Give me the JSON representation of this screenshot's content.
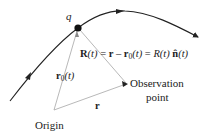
{
  "diagram": {
    "charge_label": "q",
    "equation": {
      "lhs_bold": "R",
      "lhs_arg": "(t)",
      "eq1": " = ",
      "r_bold": "r",
      "minus": " – ",
      "r0_bold": "r",
      "r0_sub": "0",
      "r0_arg": "(t)",
      "eq2": " = ",
      "mag": "R",
      "mag_arg": "(t) ",
      "n_bold": "n̂",
      "n_arg": "(t)"
    },
    "r0_label": {
      "bold": "r",
      "sub": "0",
      "arg": "(t)"
    },
    "r_label": "r",
    "observation_label_line1": "Observation",
    "observation_label_line2": "point",
    "origin_label": "Origin",
    "colors": {
      "trajectory": "#222222",
      "vector": "#b0b0b0",
      "text": "#222222"
    }
  }
}
